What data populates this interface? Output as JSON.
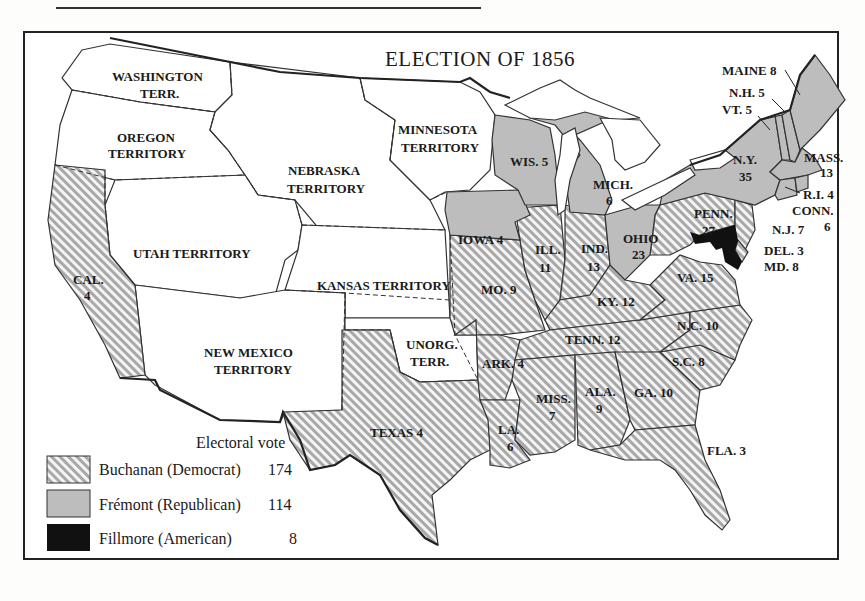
{
  "page": {
    "header_rule": true
  },
  "map": {
    "title": "ELECTION OF 1856",
    "colors": {
      "buchanan": "#ffffff-hatched-#9a9a9a",
      "fremont": "#bdbdbd",
      "fillmore": "#111111",
      "territory": "#ffffff"
    },
    "territories": [
      {
        "name": "WASHINGTON",
        "name2": "TERR."
      },
      {
        "name": "OREGON",
        "name2": "TERRITORY"
      },
      {
        "name": "NEBRASKA",
        "name2": "TERRITORY"
      },
      {
        "name": "MINNESOTA",
        "name2": "TERRITORY"
      },
      {
        "name": "UTAH TERRITORY"
      },
      {
        "name": "KANSAS TERRITORY"
      },
      {
        "name": "NEW MEXICO",
        "name2": "TERRITORY"
      },
      {
        "name": "UNORG.",
        "name2": "TERR."
      }
    ],
    "states": {
      "cal": {
        "abbr": "CAL.",
        "ev": "4",
        "party": "Buchanan"
      },
      "texas": {
        "abbr": "TEXAS 4",
        "ev": "4",
        "party": "Buchanan"
      },
      "iowa": {
        "abbr": "IOWA 4",
        "ev": "4",
        "party": "Frémont"
      },
      "wis": {
        "abbr": "WIS. 5",
        "ev": "5",
        "party": "Frémont"
      },
      "mich": {
        "abbr": "MICH.",
        "ev": "6",
        "party": "Frémont"
      },
      "ohio": {
        "abbr": "OHIO",
        "ev": "23",
        "party": "Frémont"
      },
      "ill": {
        "abbr": "ILL.",
        "ev": "11",
        "party": "Buchanan"
      },
      "ind": {
        "abbr": "IND.",
        "ev": "13",
        "party": "Buchanan"
      },
      "mo": {
        "abbr": "MO. 9",
        "ev": "9",
        "party": "Buchanan"
      },
      "ky": {
        "abbr": "KY. 12",
        "ev": "12",
        "party": "Buchanan"
      },
      "tenn": {
        "abbr": "TENN. 12",
        "ev": "12",
        "party": "Buchanan"
      },
      "ark": {
        "abbr": "ARK. 4",
        "ev": "4",
        "party": "Buchanan"
      },
      "la": {
        "abbr": "LA.",
        "ev": "6",
        "party": "Buchanan"
      },
      "miss": {
        "abbr": "MISS.",
        "ev": "7",
        "party": "Buchanan"
      },
      "ala": {
        "abbr": "ALA.",
        "ev": "9",
        "party": "Buchanan"
      },
      "ga": {
        "abbr": "GA. 10",
        "ev": "10",
        "party": "Buchanan"
      },
      "fla": {
        "abbr": "FLA. 3",
        "ev": "3",
        "party": "Buchanan"
      },
      "sc": {
        "abbr": "S.C. 8",
        "ev": "8",
        "party": "Buchanan"
      },
      "nc": {
        "abbr": "N.C. 10",
        "ev": "10",
        "party": "Buchanan"
      },
      "va": {
        "abbr": "VA. 15",
        "ev": "15",
        "party": "Buchanan"
      },
      "penn": {
        "abbr": "PENN.",
        "ev": "27",
        "party": "Buchanan"
      },
      "ny": {
        "abbr": "N.Y.",
        "ev": "35",
        "party": "Frémont"
      },
      "maine": {
        "abbr": "MAINE 8",
        "ev": "8",
        "party": "Frémont"
      },
      "nh": {
        "abbr": "N.H. 5",
        "ev": "5",
        "party": "Frémont"
      },
      "vt": {
        "abbr": "VT. 5",
        "ev": "5",
        "party": "Frémont"
      },
      "mass": {
        "abbr": "MASS.",
        "ev": "13",
        "party": "Frémont"
      },
      "ri": {
        "abbr": "R.I. 4",
        "ev": "4",
        "party": "Frémont"
      },
      "conn": {
        "abbr": "CONN.",
        "ev": "6",
        "party": "Frémont"
      },
      "nj": {
        "abbr": "N.J. 7",
        "ev": "7",
        "party": "Buchanan"
      },
      "del": {
        "abbr": "DEL. 3",
        "ev": "3",
        "party": "Buchanan"
      },
      "md": {
        "abbr": "MD. 8",
        "ev": "8",
        "party": "Fillmore"
      }
    },
    "legend": {
      "heading": "Electoral vote",
      "items": [
        {
          "label": "Buchanan (Democrat)",
          "votes": "174"
        },
        {
          "label": "Frémont (Republican)",
          "votes": "114"
        },
        {
          "label": "Fillmore (American)",
          "votes": "8"
        }
      ]
    }
  }
}
